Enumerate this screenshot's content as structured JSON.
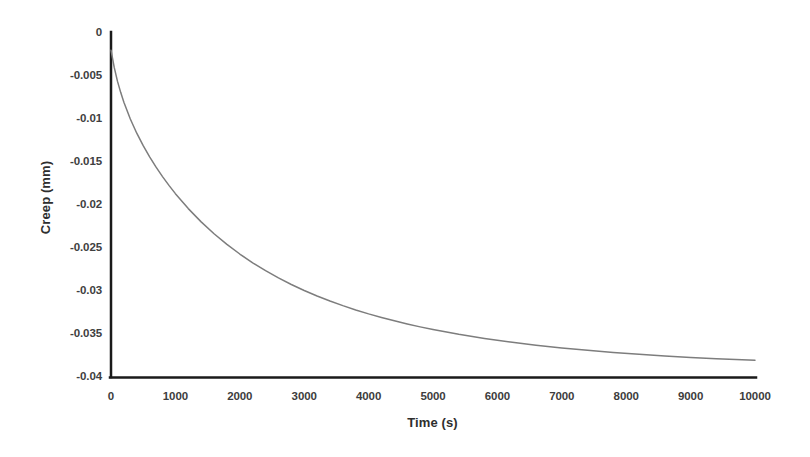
{
  "chart_data": {
    "type": "line",
    "title": "",
    "xlabel": "Time (s)",
    "ylabel": "Creep (mm)",
    "xlim": [
      0,
      10000
    ],
    "ylim": [
      -0.04,
      0
    ],
    "xticks": [
      0,
      1000,
      2000,
      3000,
      4000,
      5000,
      6000,
      7000,
      8000,
      9000,
      10000
    ],
    "xtick_labels": [
      "0",
      "1000",
      "2000",
      "3000",
      "4000",
      "5000",
      "6000",
      "7000",
      "8000",
      "9000",
      "10000"
    ],
    "yticks": [
      0,
      -0.005,
      -0.01,
      -0.015,
      -0.02,
      -0.025,
      -0.03,
      -0.035,
      -0.04
    ],
    "ytick_labels": [
      "0",
      "-0.005",
      "-0.01",
      "-0.015",
      "-0.02",
      "-0.025",
      "-0.03",
      "-0.035",
      "-0.04"
    ],
    "grid": false,
    "legend": false,
    "legend_position": "none",
    "series": [
      {
        "name": "Creep",
        "color": "#7d7d7d",
        "line_width": 1.5,
        "x": [
          0,
          50,
          100,
          150,
          200,
          300,
          400,
          500,
          600,
          700,
          800,
          900,
          1000,
          1200,
          1400,
          1600,
          1800,
          2000,
          2200,
          2400,
          2600,
          2800,
          3000,
          3200,
          3400,
          3600,
          3800,
          4000,
          4200,
          4400,
          4600,
          4800,
          5000,
          5400,
          5800,
          6200,
          6600,
          7000,
          7400,
          7800,
          8200,
          8600,
          9000,
          9400,
          9800,
          10000
        ],
        "y": [
          -0.002,
          -0.004,
          -0.0056,
          -0.0069,
          -0.00805,
          -0.01,
          -0.01165,
          -0.0131,
          -0.0144,
          -0.0156,
          -0.0167,
          -0.01772,
          -0.01868,
          -0.02042,
          -0.02196,
          -0.02334,
          -0.02458,
          -0.0257,
          -0.02672,
          -0.02764,
          -0.02848,
          -0.02924,
          -0.02994,
          -0.03058,
          -0.03116,
          -0.0317,
          -0.0322,
          -0.03266,
          -0.03308,
          -0.03347,
          -0.03383,
          -0.03417,
          -0.03448,
          -0.03504,
          -0.03552,
          -0.03594,
          -0.0363,
          -0.03662,
          -0.0369,
          -0.03715,
          -0.03736,
          -0.03755,
          -0.03772,
          -0.03787,
          -0.038,
          -0.03806
        ]
      }
    ],
    "axis_color": "#1a1a1a",
    "axis_width": 2.5,
    "background": "#ffffff"
  }
}
